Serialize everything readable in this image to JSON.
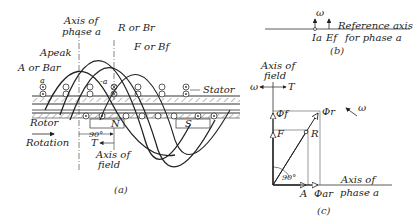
{
  "figure_a": {
    "caption": "(a)",
    "labels": {
      "axis_phase_a_1": "Axis of",
      "axis_phase_a_2": "phase a",
      "r_or_br": "R or Br",
      "f_or_bf": "F or Bf",
      "a_peak": "Apeak",
      "a_or_bar": "A or Bar",
      "a": "a",
      "neg_a": "-a",
      "stator": "Stator",
      "rotor": "Rotor",
      "rotation": "Rotation",
      "n_pole": "N",
      "s_pole": "S",
      "angle": "90°",
      "torque": "T",
      "axis_field_1": "Axis of",
      "axis_field_2": "field"
    }
  },
  "figure_b": {
    "caption": "(b)",
    "labels": {
      "omega": "ω",
      "ia": "Ia",
      "ef": "Ef",
      "ref_axis_1": "Reference axis",
      "ref_axis_2": "for phase a"
    }
  },
  "figure_c": {
    "caption": "(c)",
    "labels": {
      "axis_field_1": "Axis of",
      "axis_field_2": "field",
      "omega_left": "ω",
      "torque": "T",
      "phi_f": "Φf",
      "phi_r": "Φr",
      "omega_rot": "ω",
      "f": "F",
      "r": "R",
      "angle": "90°",
      "a": "A",
      "phi_ar": "Φar",
      "axis_phase_1": "Axis of",
      "axis_phase_2": "phase a"
    }
  }
}
